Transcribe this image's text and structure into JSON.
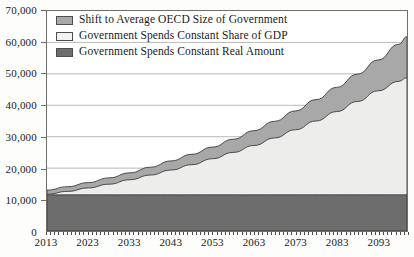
{
  "chart_data": {
    "type": "area",
    "title": "",
    "subtitle": "",
    "xlabel": "",
    "ylabel": "",
    "stacked": true,
    "grid": true,
    "legend_position": "top-left",
    "xlim": [
      2013,
      2100
    ],
    "ylim": [
      0,
      70000
    ],
    "y_ticks": [
      0,
      10000,
      20000,
      30000,
      40000,
      50000,
      60000,
      70000
    ],
    "y_tick_labels": [
      "0",
      "10,000",
      "20,000",
      "30,000",
      "40,000",
      "50,000",
      "60,000",
      "70,000"
    ],
    "x_ticks": [
      2013,
      2023,
      2033,
      2043,
      2053,
      2063,
      2073,
      2083,
      2093
    ],
    "x_tick_labels": [
      "2013",
      "2023",
      "2033",
      "2043",
      "2053",
      "2063",
      "2073",
      "2083",
      "2093"
    ],
    "x_minor_tick_interval": 1,
    "x": [
      2013,
      2018,
      2023,
      2028,
      2033,
      2038,
      2043,
      2048,
      2053,
      2058,
      2063,
      2068,
      2073,
      2078,
      2083,
      2088,
      2093,
      2098,
      2100
    ],
    "series": [
      {
        "name": "Government Spends Constant Real Amount",
        "color": "#6d6d6d",
        "stack_order": 1,
        "values": [
          11500,
          11500,
          11500,
          11500,
          11500,
          11500,
          11500,
          11500,
          11500,
          11500,
          11500,
          11500,
          11500,
          11500,
          11500,
          11500,
          11500,
          11500,
          11500
        ]
      },
      {
        "name": "Government Spends Constant Share of GDP",
        "color": "#ededeb",
        "stack_order": 2,
        "cumulative_top": [
          11700,
          12600,
          13700,
          14900,
          16300,
          17800,
          19400,
          21100,
          23000,
          25000,
          27200,
          29600,
          32200,
          35000,
          38000,
          41200,
          44600,
          47600,
          48800
        ]
      },
      {
        "name": "Shift to Average OECD Size of Government",
        "color": "#a8a8a8",
        "stack_order": 3,
        "cumulative_top": [
          13000,
          14100,
          15400,
          16900,
          18500,
          20300,
          22300,
          24400,
          26700,
          29200,
          31900,
          34900,
          38200,
          41800,
          45700,
          49900,
          54400,
          59400,
          61800
        ]
      }
    ]
  },
  "legend": {
    "items": [
      {
        "label": "Shift to Average OECD Size of Government",
        "swatch_color": "#a8a8a8"
      },
      {
        "label": "Government Spends Constant Share of GDP",
        "swatch_color": "#f2f2f0"
      },
      {
        "label": "Government Spends Constant Real Amount",
        "swatch_color": "#6d6d6d"
      }
    ]
  },
  "axes": {
    "y_label_0": "0",
    "y_label_1": "10,000",
    "y_label_2": "20,000",
    "y_label_3": "30,000",
    "y_label_4": "40,000",
    "y_label_5": "50,000",
    "y_label_6": "60,000",
    "y_label_7": "70,000"
  }
}
